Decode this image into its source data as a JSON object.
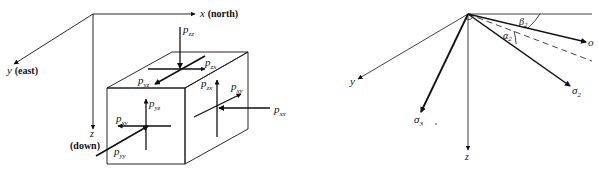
{
  "left_diagram": {
    "axes": {
      "x": {
        "symbol": "x",
        "note": "(north)"
      },
      "y": {
        "symbol": "y",
        "note": "(east)"
      },
      "z": {
        "symbol": "z",
        "note": "(down)"
      }
    },
    "stress_labels": {
      "pzz": {
        "base": "p",
        "sub": "zz"
      },
      "pzx_top": {
        "base": "p",
        "sub": "zx"
      },
      "pyz_top": {
        "base": "p",
        "sub": "yz"
      },
      "pzx_side": {
        "base": "p",
        "sub": "zx"
      },
      "pxy_side": {
        "base": "p",
        "sub": "xy"
      },
      "pxx": {
        "base": "p",
        "sub": "xx"
      },
      "pyz_front": {
        "base": "p",
        "sub": "yz"
      },
      "pxy_front": {
        "base": "p",
        "sub": "xy"
      },
      "pyy": {
        "base": "p",
        "sub": "yy"
      }
    }
  },
  "right_diagram": {
    "axes": {
      "y": "y",
      "z": "z"
    },
    "vectors": {
      "o": {
        "base": "o",
        "sub": ""
      },
      "sigma2": {
        "base": "σ",
        "sub": "2"
      },
      "sigma3": {
        "base": "σ",
        "sub": "3"
      }
    },
    "angles": {
      "beta2": {
        "base": "β",
        "sub": "2"
      },
      "alpha2": {
        "base": "α",
        "sub": "2"
      }
    }
  },
  "colors": {
    "ink": "#111111",
    "background": "#ffffff"
  }
}
